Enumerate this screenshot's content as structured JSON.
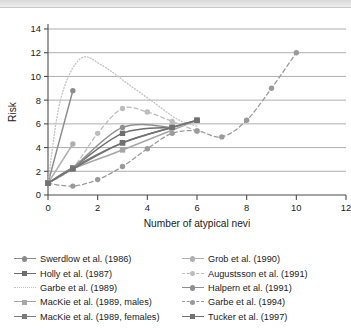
{
  "chart_data": {
    "type": "line",
    "title": "",
    "xlabel": "Number of atypical nevi",
    "ylabel": "Risk",
    "xlim": [
      0,
      12
    ],
    "ylim": [
      0,
      14
    ],
    "xticks": [
      0,
      2,
      4,
      6,
      8,
      10,
      12
    ],
    "yticks": [
      0,
      2,
      4,
      6,
      8,
      10,
      12,
      14
    ],
    "grid": "horizontal",
    "legend_position": "bottom",
    "legend_columns": 2,
    "series": [
      {
        "name": "Swerdlow et al. (1986)",
        "color": "#8c8c8c",
        "dash": "solid",
        "marker": "circle",
        "x": [
          0,
          1
        ],
        "y": [
          1.0,
          8.8
        ]
      },
      {
        "name": "Holly et al. (1987)",
        "color": "#6e6e6e",
        "dash": "solid",
        "marker": "square",
        "x": [
          0,
          1,
          3,
          5
        ],
        "y": [
          1.0,
          2.3,
          5.2,
          5.7
        ]
      },
      {
        "name": "Garbe et al. (1989)",
        "color": "#c2c2c2",
        "dash": "dotted",
        "marker": "none",
        "x": [
          0,
          0.5,
          1.3,
          2.2,
          3.2,
          4.2,
          5.2,
          6.0
        ],
        "y": [
          1.0,
          8.0,
          11.5,
          10.9,
          9.4,
          7.9,
          6.4,
          5.8
        ]
      },
      {
        "name": "MacKie et al. (1989, males)",
        "color": "#a6a6a6",
        "dash": "solid",
        "marker": "square",
        "x": [
          0,
          1,
          3,
          6
        ],
        "y": [
          1.0,
          2.2,
          3.8,
          6.3
        ]
      },
      {
        "name": "MacKie et al. (1989, females)",
        "color": "#7a7a7a",
        "dash": "solid",
        "marker": "square",
        "x": [
          0,
          1,
          3,
          6
        ],
        "y": [
          1.0,
          2.3,
          4.4,
          6.3
        ]
      },
      {
        "name": "Grob et al. (1990)",
        "color": "#b0b0b0",
        "dash": "solid",
        "marker": "circle",
        "x": [
          0,
          1
        ],
        "y": [
          1.0,
          4.3
        ]
      },
      {
        "name": "Augustsson et al. (1991)",
        "color": "#bdbdbd",
        "dash": "dashed",
        "marker": "circle",
        "x": [
          0,
          1,
          2,
          3,
          4,
          5,
          6
        ],
        "y": [
          1.0,
          2.3,
          5.2,
          7.3,
          7.0,
          6.2,
          5.4
        ]
      },
      {
        "name": "Halpern et al. (1991)",
        "color": "#8f8f8f",
        "dash": "solid",
        "marker": "circle",
        "x": [
          0,
          1,
          3,
          5
        ],
        "y": [
          1.0,
          2.3,
          5.7,
          5.7
        ]
      },
      {
        "name": "Garbe et al. (1994)",
        "color": "#9a9a9a",
        "dash": "dashed",
        "marker": "circle",
        "x": [
          0,
          1,
          2,
          3,
          4,
          5,
          6,
          7,
          8,
          9,
          10
        ],
        "y": [
          1.0,
          0.75,
          1.3,
          2.4,
          3.9,
          5.2,
          5.4,
          4.9,
          6.3,
          9.0,
          12.0
        ]
      },
      {
        "name": "Tucker et al. (1997)",
        "color": "#717171",
        "dash": "solid",
        "marker": "square",
        "x": [
          0,
          1,
          3,
          5,
          6
        ],
        "y": [
          1.0,
          2.2,
          4.4,
          5.7,
          6.3
        ]
      }
    ]
  },
  "legend": {
    "left_column": [
      "Swerdlow et al. (1986)",
      "Holly et al. (1987)",
      "Garbe et al. (1989)",
      "MacKie et al. (1989, males)",
      "MacKie et al. (1989, females)"
    ],
    "right_column": [
      "Grob et al. (1990)",
      "Augustsson et al. (1991)",
      "Halpern et al. (1991)",
      "Garbe et al. (1994)",
      "Tucker et al. (1997)"
    ]
  }
}
